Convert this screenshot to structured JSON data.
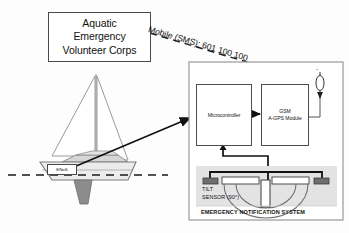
{
  "diagram": {
    "organisation_box": {
      "label": "Aquatic\nEmergency\nVolunteer Corps"
    },
    "link": {
      "label": "Mobile (SMS): 601 100 100",
      "style": "dashed",
      "color": "#1a1a1a"
    },
    "vessel": {
      "name": "sailboat",
      "hull_plate_label": "ENoS",
      "waterline": "dashed",
      "sail_color": "#ffffff",
      "hull_color": "#e8e8e8",
      "keel_color": "#8c8c8c"
    },
    "panel": {
      "caption": "EMERGENCY NOTIFICATION SYSTEM",
      "border_color": "#9a9a9a",
      "blocks": [
        {
          "id": "mcu",
          "label": "Microcontroller"
        },
        {
          "id": "gsm",
          "label": "GSM\nA-GPS Module"
        }
      ],
      "antenna": {
        "name": "antenna",
        "glyph": "⌁"
      },
      "sensor": {
        "label": "TILT\nSENSOR (90°)",
        "band_color": "#e3e3e3",
        "pad_color": "#6e6e6e",
        "electrode_color": "#ffffff"
      }
    }
  }
}
